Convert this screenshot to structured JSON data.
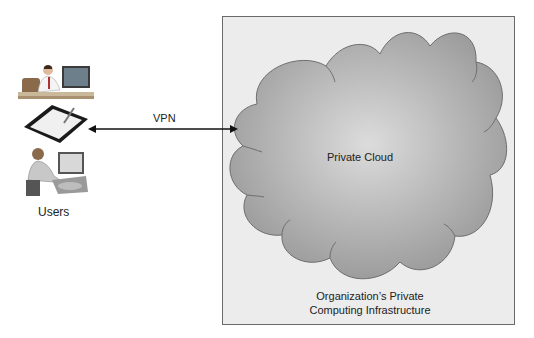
{
  "diagram": {
    "type": "private-cloud-architecture",
    "users": {
      "label": "Users",
      "devices": [
        {
          "name": "desktop-user",
          "icon": "person-at-desktop-icon"
        },
        {
          "name": "tablet",
          "icon": "tablet-with-stylus-icon"
        },
        {
          "name": "laptop-user",
          "icon": "person-at-laptop-icon"
        }
      ]
    },
    "connection": {
      "label": "VPN",
      "style": "bidirectional-arrow"
    },
    "cloud": {
      "label": "Private Cloud"
    },
    "infrastructure": {
      "label_line1": "Organization’s Private",
      "label_line2": "Computing Infrastructure"
    },
    "colors": {
      "box_fill": "#ececec",
      "box_border": "#6a6a6a",
      "cloud_fill_light": "#d2d2d2",
      "cloud_fill_dark": "#9a9a9a",
      "cloud_stroke": "#6e6e6e",
      "arrow": "#111111"
    }
  }
}
